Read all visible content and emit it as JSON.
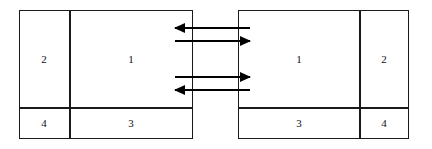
{
  "figure": {
    "title": "",
    "background_color": "#ffffff",
    "stroke_color": "#1a1a1a",
    "arrow_color": "#000000"
  },
  "blocks": [
    {
      "name": "left-block",
      "x": 19,
      "y": 10,
      "width": 174,
      "height": 129,
      "vertical_divider_x": 69,
      "horizontal_divider_y": 107,
      "cells": [
        {
          "name": "left-cell-2",
          "label": "2",
          "cx": 44,
          "cy": 59
        },
        {
          "name": "left-cell-1",
          "label": "1",
          "cx": 131,
          "cy": 59
        },
        {
          "name": "left-cell-4",
          "label": "4",
          "cx": 44,
          "cy": 123
        },
        {
          "name": "left-cell-3",
          "label": "3",
          "cx": 131,
          "cy": 123
        }
      ]
    },
    {
      "name": "right-block",
      "x": 238,
      "y": 10,
      "width": 171,
      "height": 129,
      "vertical_divider_x": 359,
      "horizontal_divider_y": 107,
      "cells": [
        {
          "name": "right-cell-1",
          "label": "1",
          "cx": 299,
          "cy": 59
        },
        {
          "name": "right-cell-2",
          "label": "2",
          "cx": 384,
          "cy": 59
        },
        {
          "name": "right-cell-3",
          "label": "3",
          "cx": 299,
          "cy": 123
        },
        {
          "name": "right-cell-4",
          "label": "4",
          "cx": 384,
          "cy": 123
        }
      ]
    }
  ],
  "arrows": [
    {
      "name": "arrow-1-leftward",
      "direction": "left",
      "y": 28,
      "x_start": 175,
      "x_end": 250,
      "label": ""
    },
    {
      "name": "arrow-2-rightward",
      "direction": "right",
      "y": 41,
      "x_start": 175,
      "x_end": 250,
      "label": ""
    },
    {
      "name": "arrow-3-rightward",
      "direction": "right",
      "y": 77,
      "x_start": 175,
      "x_end": 250,
      "label": ""
    },
    {
      "name": "arrow-4-leftward",
      "direction": "left",
      "y": 90,
      "x_start": 175,
      "x_end": 250,
      "label": ""
    }
  ]
}
